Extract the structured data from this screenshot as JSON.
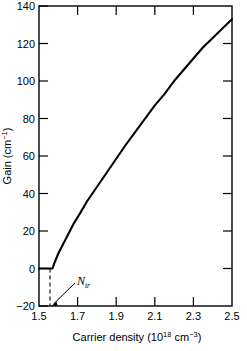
{
  "chart_data": {
    "type": "line",
    "title": "",
    "xlabel": "Carrier density (10^18 cm^-3)",
    "xlabel_parts": {
      "main": "Carrier density (10",
      "exp1": "18",
      "mid": " cm",
      "exp2": "−3",
      "tail": ")"
    },
    "ylabel": "Gain (cm^-1)",
    "ylabel_parts": {
      "main": "Gain (cm",
      "exp": "−1",
      "tail": ")"
    },
    "xlim": [
      1.5,
      2.5
    ],
    "ylim": [
      -20,
      140
    ],
    "xticks": [
      1.5,
      1.7,
      1.9,
      2.1,
      2.3,
      2.5
    ],
    "xtick_labels": [
      "1.5",
      "1.7",
      "1.9",
      "2.1",
      "2.3",
      "2.5"
    ],
    "yticks": [
      -20,
      0,
      20,
      40,
      60,
      80,
      100,
      120,
      140
    ],
    "ytick_labels": [
      "−20",
      "0",
      "20",
      "40",
      "60",
      "80",
      "100",
      "120",
      "140"
    ],
    "grid": false,
    "legend": null,
    "line_color": "#000000",
    "series": [
      {
        "name": "gain",
        "x": [
          1.5,
          1.52,
          1.54,
          1.56,
          1.57,
          1.58,
          1.6,
          1.62,
          1.65,
          1.68,
          1.71,
          1.75,
          1.79,
          1.83,
          1.87,
          1.91,
          1.95,
          2.0,
          2.05,
          2.1,
          2.15,
          2.2,
          2.25,
          2.3,
          2.35,
          2.4,
          2.45,
          2.5
        ],
        "y": [
          0,
          0,
          0,
          0,
          0,
          3,
          8,
          12,
          18,
          24,
          29,
          36,
          42,
          48,
          54,
          60,
          66,
          73,
          80,
          87,
          93,
          100,
          106,
          112,
          118,
          123,
          128,
          133
        ]
      }
    ],
    "annotations": [
      {
        "name": "Ntr",
        "label_main": "N",
        "label_sub": "tr",
        "x_value": 1.57,
        "y_value": -20,
        "note": "transparency carrier density marked by dashed vertical line from gain=0 down to axis, with arrow from label"
      }
    ]
  },
  "axes": {
    "box_color": "#000000"
  }
}
